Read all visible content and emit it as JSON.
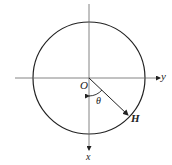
{
  "diagram": {
    "labels": {
      "origin": "O",
      "angle": "θ",
      "vector": "H",
      "y_axis": "y",
      "x_axis": "x"
    },
    "colors": {
      "stroke": "#222222",
      "axis": "#555555",
      "background": "#ffffff"
    },
    "geometry": {
      "center": [
        89,
        78
      ],
      "radius": 56,
      "vector_end": [
        128,
        115
      ]
    }
  }
}
